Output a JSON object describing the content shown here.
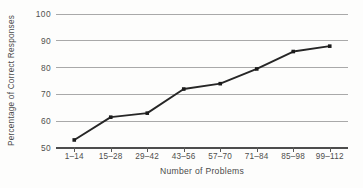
{
  "chart_data": {
    "type": "line",
    "title": "",
    "xlabel": "Number of Problems",
    "ylabel": "Percentage of Correct Responses",
    "categories": [
      "1–14",
      "15–28",
      "29–42",
      "43–56",
      "57–70",
      "71–84",
      "85–98",
      "99–112"
    ],
    "values": [
      53,
      61.5,
      63,
      72,
      74,
      79.5,
      86,
      88
    ],
    "y_ticks": [
      50,
      60,
      70,
      80,
      90,
      100
    ],
    "y_tick_labels": [
      "50",
      "60",
      "70",
      "80",
      "90",
      "100"
    ],
    "ylim": [
      50,
      100
    ],
    "grid": "horizontal",
    "legend": "none",
    "series": [
      {
        "name": "Percentage of Correct Responses",
        "values": [
          53,
          61.5,
          63,
          72,
          74,
          79.5,
          86,
          88
        ]
      }
    ],
    "marker": "square",
    "colors": {
      "line": "#262626",
      "marker": "#1b1b1b",
      "gridline": "#a9a9a9",
      "axis": "#4d4d4d",
      "text": "#4a4a4a",
      "background": "#fdfdfc"
    }
  }
}
